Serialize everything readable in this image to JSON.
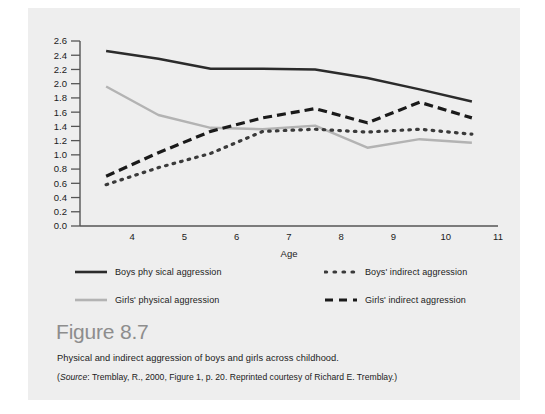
{
  "figure": {
    "number_label": "Figure 8.7",
    "caption": "Physical and indirect aggression of boys and girls across childhood.",
    "source_prefix": "(",
    "source_italic": "Source",
    "source_text": ": Tremblay, R., 2000, Figure 1, p. 20. Reprinted courtesy of Richard E. Tremblay.)"
  },
  "legend": {
    "items": [
      {
        "label": "Boys phy sical aggression",
        "style": "solid",
        "color": "#2b2b2b",
        "name": "boys-physical"
      },
      {
        "label": "Girls' physical aggression",
        "style": "solid",
        "color": "#b3b3b3",
        "name": "girls-physical"
      },
      {
        "label": "Boys' indirect aggression",
        "style": "dotted",
        "color": "#3a3a3a",
        "name": "boys-indirect"
      },
      {
        "label": "Girls' indirect aggression",
        "style": "dashed",
        "color": "#1a1a1a",
        "name": "girls-indirect"
      }
    ]
  },
  "colors": {
    "card_background": "#eeeeee",
    "page_background": "#ffffff",
    "axis": "#555555",
    "boys_physical": "#2b2b2b",
    "girls_physical": "#b3b3b3",
    "boys_indirect": "#3a3a3a",
    "girls_indirect": "#1a1a1a",
    "figure_number": "#8d8d8d",
    "text": "#1b1b1b"
  },
  "chart_data": {
    "type": "line",
    "title": "",
    "xlabel": "Age",
    "ylabel": "",
    "xlim": [
      3,
      11
    ],
    "ylim": [
      0.0,
      2.6
    ],
    "grid": false,
    "legend_position": "below-plot",
    "x_ticks": [
      4,
      5,
      6,
      7,
      8,
      9,
      10,
      11
    ],
    "x_tick_labels": [
      "4",
      "5",
      "6",
      "7",
      "8",
      "9",
      "10",
      "11"
    ],
    "y_ticks": [
      0.0,
      0.2,
      0.4,
      0.6,
      0.8,
      1.0,
      1.2,
      1.4,
      1.6,
      1.8,
      2.0,
      2.2,
      2.4,
      2.6
    ],
    "y_tick_labels": [
      "0.0",
      "0.2",
      "0.4",
      "0.6",
      "0.8",
      "1.0",
      "1.2",
      "1.4",
      "1.6",
      "1.8",
      "2.0",
      "2.2",
      "2.4",
      "2.6"
    ],
    "x": [
      3.5,
      4.5,
      5.5,
      6.5,
      7.5,
      8.5,
      9.5,
      10.5
    ],
    "series": [
      {
        "name": "Boys phy sical aggression",
        "style": "solid",
        "color": "#2b2b2b",
        "values": [
          2.46,
          2.35,
          2.21,
          2.21,
          2.2,
          2.08,
          1.92,
          1.75
        ]
      },
      {
        "name": "Girls' physical aggression",
        "style": "solid",
        "color": "#b3b3b3",
        "values": [
          1.96,
          1.56,
          1.38,
          1.36,
          1.41,
          1.1,
          1.22,
          1.17
        ]
      },
      {
        "name": "Boys' indirect aggression",
        "style": "dotted",
        "color": "#3a3a3a",
        "values": [
          0.58,
          0.82,
          1.02,
          1.33,
          1.36,
          1.32,
          1.36,
          1.29
        ]
      },
      {
        "name": "Girls' indirect aggression",
        "style": "dashed",
        "color": "#1a1a1a",
        "values": [
          0.7,
          1.03,
          1.33,
          1.52,
          1.65,
          1.45,
          1.74,
          1.52
        ]
      }
    ]
  }
}
